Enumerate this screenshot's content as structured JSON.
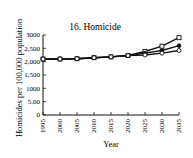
{
  "chart_data": {
    "type": "line",
    "title": "16. Homicide",
    "xlabel": "Year",
    "ylabel": "Homicides per 100,000 population",
    "x": [
      1995,
      2000,
      2005,
      2010,
      2015,
      2020,
      2025,
      2030,
      2035
    ],
    "x_tick_labels": [
      "1995",
      "2000",
      "2005",
      "2010",
      "2015",
      "2020",
      "2025",
      "2030",
      "2035"
    ],
    "y_tick_labels": [
      "0",
      "5,00",
      "1000",
      "1,500",
      "2,000",
      "2,500",
      "3000"
    ],
    "y_tick_values": [
      0,
      500,
      1000,
      1500,
      2000,
      2500,
      3000
    ],
    "ylim": [
      0,
      3000
    ],
    "xlim": [
      1995,
      2035
    ],
    "grid": false,
    "legend": null,
    "series": [
      {
        "name": "High projection",
        "marker": "open-square",
        "values": [
          2100,
          2100,
          2110,
          2150,
          2180,
          2230,
          2380,
          2580,
          2900
        ]
      },
      {
        "name": "Middle projection",
        "marker": "filled-circle",
        "values": [
          2100,
          2100,
          2110,
          2150,
          2180,
          2230,
          2320,
          2420,
          2600
        ]
      },
      {
        "name": "Low projection",
        "marker": "open-circle",
        "values": [
          2100,
          2100,
          2110,
          2150,
          2180,
          2230,
          2250,
          2320,
          2420
        ]
      }
    ]
  },
  "colors": {
    "line": "#111111",
    "background": "#ffffff"
  }
}
